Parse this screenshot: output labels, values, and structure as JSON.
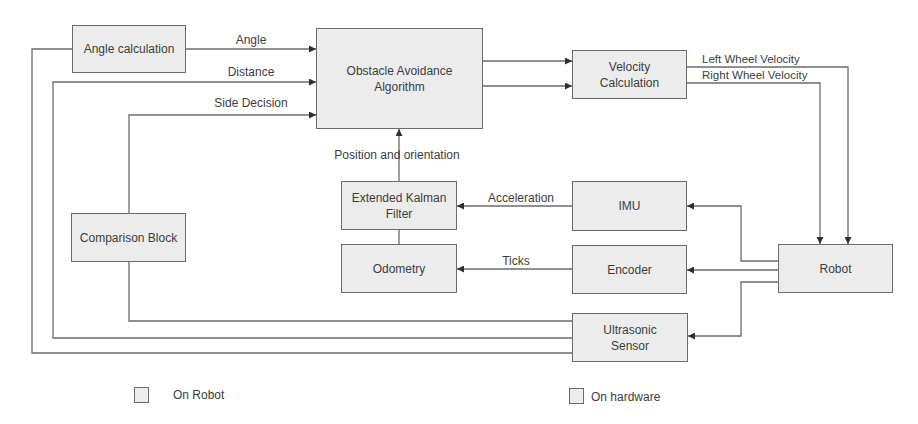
{
  "diagram": {
    "blocks": {
      "angle_calculation": "Angle calculation",
      "obstacle_avoidance": "Obstacle Avoidance\nAlgorithm",
      "velocity_calculation": "Velocity\nCalculation",
      "extended_kalman_filter": "Extended Kalman\nFilter",
      "odometry": "Odometry",
      "imu": "IMU",
      "encoder": "Encoder",
      "robot": "Robot",
      "comparison_block": "Comparison Block",
      "ultrasonic_sensor": "Ultrasonic\nSensor"
    },
    "signals": {
      "angle": "Angle",
      "distance": "Distance",
      "side_decision": "Side Decision",
      "left_wheel_velocity": "Left Wheel Velocity",
      "right_wheel_velocity": "Right Wheel Velocity",
      "position_orientation": "Position and orientation",
      "acceleration": "Acceleration",
      "ticks": "Ticks"
    },
    "legend": [
      {
        "label": "On Robot",
        "color": "#ececec"
      },
      {
        "label": "On hardware",
        "color": "#ececec"
      }
    ],
    "colors": {
      "block_fill": "#ececec",
      "block_border": "#6b6b6b",
      "wire": "#6b6b6b",
      "text": "#3c3c3c"
    }
  }
}
